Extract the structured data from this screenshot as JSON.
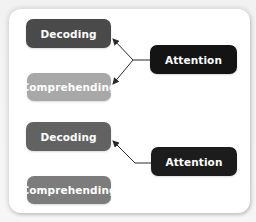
{
  "diagram": {
    "groups": [
      {
        "id": "group-1",
        "source": {
          "label": "Attention",
          "color": "#141414"
        },
        "targets": [
          {
            "label": "Decoding",
            "color": "#4a4a4a"
          },
          {
            "label": "Comprehending",
            "color": "#a8a8a8"
          }
        ]
      },
      {
        "id": "group-2",
        "source": {
          "label": "Attention",
          "color": "#1c1c1c"
        },
        "targets": [
          {
            "label": "Decoding",
            "color": "#626262"
          },
          {
            "label": "Comprehending",
            "color": "#7c7c7c"
          }
        ]
      }
    ],
    "arrow_color": "#2a2a2a",
    "panel_color": "#ffffff"
  }
}
